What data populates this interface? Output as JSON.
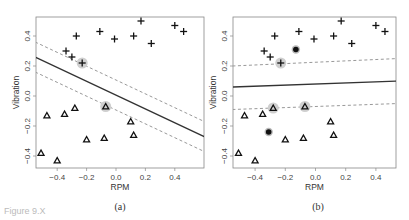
{
  "chart_data": [
    {
      "type": "scatter",
      "panel": "(a)",
      "xlabel": "RPM",
      "ylabel": "Vibration",
      "xlim": [
        -0.55,
        0.6
      ],
      "ylim": [
        -0.48,
        0.53
      ],
      "xticks": [
        "-0.4",
        "-0.2",
        "0.0",
        "0.2",
        "0.4"
      ],
      "yticks": [
        "-0.4",
        "-0.2",
        "0.0",
        "0.2",
        "0.4"
      ],
      "grid": false,
      "series": [
        {
          "name": "plus",
          "marker": "+",
          "points": [
            [
              -0.34,
              0.3
            ],
            [
              -0.3,
              0.26
            ],
            [
              -0.27,
              0.4
            ],
            [
              -0.11,
              0.43
            ],
            [
              -0.01,
              0.38
            ],
            [
              0.12,
              0.4
            ],
            [
              0.17,
              0.5
            ],
            [
              0.24,
              0.35
            ],
            [
              0.4,
              0.47
            ],
            [
              0.46,
              0.43
            ],
            [
              -0.23,
              0.22
            ]
          ]
        },
        {
          "name": "triangle",
          "marker": "triangle",
          "points": [
            [
              -0.07,
              -0.07
            ],
            [
              -0.28,
              -0.08
            ],
            [
              -0.35,
              -0.12
            ],
            [
              -0.47,
              -0.13
            ],
            [
              0.1,
              -0.17
            ],
            [
              0.12,
              -0.26
            ],
            [
              -0.2,
              -0.29
            ],
            [
              -0.08,
              -0.28
            ],
            [
              -0.51,
              -0.38
            ],
            [
              -0.4,
              -0.43
            ]
          ]
        }
      ],
      "support_vectors": [
        [
          -0.23,
          0.22
        ],
        [
          -0.07,
          -0.07
        ]
      ],
      "decision_boundary": {
        "style": "solid",
        "from": [
          -0.55,
          0.26
        ],
        "to": [
          0.6,
          -0.27
        ]
      },
      "margins": [
        {
          "style": "dashed",
          "from": [
            -0.55,
            0.36
          ],
          "to": [
            0.6,
            -0.17
          ]
        },
        {
          "style": "dashed",
          "from": [
            -0.55,
            0.16
          ],
          "to": [
            0.6,
            -0.37
          ]
        }
      ]
    },
    {
      "type": "scatter",
      "panel": "(b)",
      "xlabel": "RPM",
      "ylabel": "Vibration",
      "xlim": [
        -0.55,
        0.55
      ],
      "ylim": [
        -0.48,
        0.53
      ],
      "xticks": [
        "-0.4",
        "-0.2",
        "0.0",
        "0.2",
        "0.4"
      ],
      "yticks": [
        "-0.4",
        "-0.2",
        "0.0",
        "0.2",
        "0.4"
      ],
      "grid": false,
      "series": [
        {
          "name": "plus",
          "marker": "+",
          "points": [
            [
              -0.34,
              0.3
            ],
            [
              -0.3,
              0.26
            ],
            [
              -0.27,
              0.4
            ],
            [
              -0.11,
              0.43
            ],
            [
              -0.01,
              0.38
            ],
            [
              0.12,
              0.4
            ],
            [
              0.17,
              0.5
            ],
            [
              0.24,
              0.35
            ],
            [
              0.4,
              0.47
            ],
            [
              0.46,
              0.43
            ],
            [
              -0.23,
              0.22
            ]
          ]
        },
        {
          "name": "triangle",
          "marker": "triangle",
          "points": [
            [
              -0.07,
              -0.07
            ],
            [
              -0.28,
              -0.08
            ],
            [
              -0.35,
              -0.12
            ],
            [
              -0.47,
              -0.13
            ],
            [
              0.1,
              -0.17
            ],
            [
              0.12,
              -0.26
            ],
            [
              -0.2,
              -0.29
            ],
            [
              -0.08,
              -0.28
            ],
            [
              -0.51,
              -0.38
            ],
            [
              -0.4,
              -0.43
            ]
          ]
        },
        {
          "name": "outlier",
          "marker": "filled-circle",
          "points": [
            [
              -0.13,
              0.31
            ],
            [
              -0.31,
              -0.24
            ]
          ]
        }
      ],
      "support_vectors": [
        [
          -0.23,
          0.22
        ],
        [
          -0.28,
          -0.08
        ],
        [
          -0.07,
          -0.07
        ]
      ],
      "decision_boundary": {
        "style": "solid",
        "from": [
          -0.55,
          0.06
        ],
        "to": [
          0.55,
          0.1
        ]
      },
      "margins": [
        {
          "style": "dashed",
          "from": [
            -0.55,
            0.2
          ],
          "to": [
            0.55,
            0.25
          ]
        },
        {
          "style": "dashed",
          "from": [
            -0.55,
            -0.09
          ],
          "to": [
            0.55,
            -0.05
          ]
        }
      ]
    }
  ],
  "captions": {
    "a": "(a)",
    "b": "(b)",
    "figure": "Figure 9.X"
  }
}
